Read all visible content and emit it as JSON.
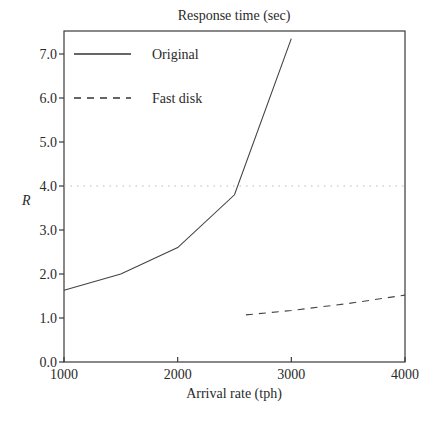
{
  "chart_data": {
    "type": "line",
    "title": "Response time (sec)",
    "xlabel": "Arrival rate (tph)",
    "ylabel": "R",
    "xlim": [
      1000,
      4000
    ],
    "ylim": [
      0.0,
      7.5
    ],
    "xticks": [
      1000,
      2000,
      3000,
      4000
    ],
    "xtick_labels": [
      "1000",
      "2000",
      "3000",
      "4000"
    ],
    "yticks": [
      0,
      1,
      2,
      3,
      4,
      5,
      6,
      7
    ],
    "ytick_labels": [
      "0.0",
      "1.0",
      "2.0",
      "3.0",
      "4.0",
      "5.0",
      "6.0",
      "7.0"
    ],
    "grid": false,
    "legend_position": "top-left",
    "series": [
      {
        "name": "Original",
        "style": "solid",
        "x": [
          1000,
          1500,
          2000,
          2500,
          3000
        ],
        "y": [
          1.63,
          2.0,
          2.6,
          3.8,
          7.35
        ]
      },
      {
        "name": "Fast disk",
        "style": "dashed",
        "x": [
          2600,
          3000,
          3500,
          4000
        ],
        "y": [
          1.07,
          1.17,
          1.33,
          1.52
        ]
      }
    ],
    "reference_lines": [
      {
        "axis": "y",
        "value": 4.0,
        "style": "dotted"
      }
    ]
  }
}
